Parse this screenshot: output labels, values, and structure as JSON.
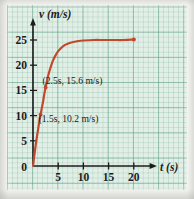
{
  "chart_data": {
    "type": "line",
    "title": "",
    "xlabel": "t (s)",
    "ylabel": "v (m/s)",
    "xlim": [
      0,
      22
    ],
    "ylim": [
      0,
      27
    ],
    "xticks": [
      "5",
      "10",
      "15",
      "20"
    ],
    "yticks": [
      "5",
      "10",
      "15",
      "20",
      "25"
    ],
    "origin_label": "0",
    "grid": true,
    "grid_style": "graph-paper",
    "legend": "none",
    "series": [
      {
        "name": "velocity",
        "color": "#c0492c",
        "x": [
          0,
          0.25,
          0.5,
          0.75,
          1.0,
          1.25,
          1.5,
          1.75,
          2.0,
          2.25,
          2.5,
          3.0,
          3.5,
          4.0,
          4.5,
          5.0,
          6.0,
          7.0,
          8.0,
          9.0,
          10.0,
          12.0,
          14.0,
          16.0,
          18.0,
          20.0
        ],
        "y": [
          0,
          2.0,
          3.9,
          5.6,
          7.2,
          8.8,
          10.2,
          11.5,
          12.8,
          14.3,
          15.6,
          17.9,
          19.6,
          21.0,
          22.0,
          22.8,
          23.8,
          24.3,
          24.6,
          24.8,
          24.9,
          25.0,
          25.0,
          25.0,
          25.0,
          25.1
        ]
      }
    ],
    "endpoint_marker": {
      "x": 20,
      "y": 25.1
    },
    "annotations": [
      {
        "label": "(2.5s, 15.6 m/s)",
        "x": 2.5,
        "y": 15.6
      },
      {
        "label": "(1.5s, 10.2 m/s)",
        "x": 1.5,
        "y": 10.2
      }
    ],
    "colors": {
      "curve": "#c0492c",
      "axis": "#1b1b1b",
      "paper": "#e2efe7",
      "grid": "#5fa087"
    }
  }
}
